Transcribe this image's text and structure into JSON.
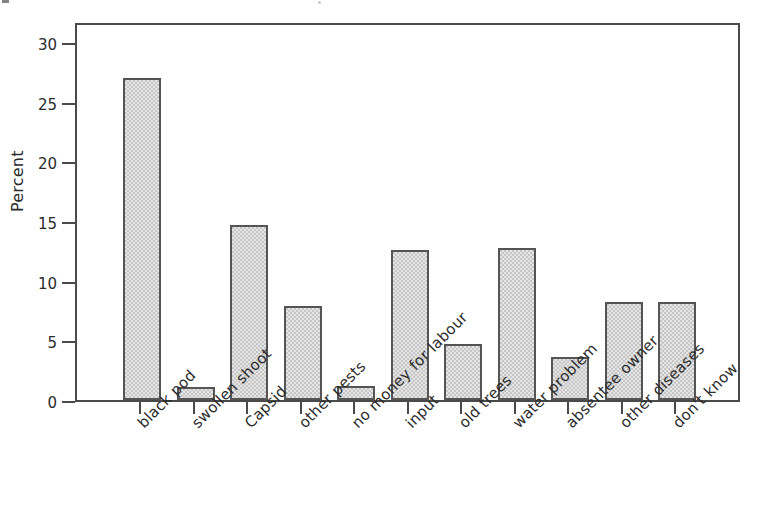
{
  "figure": {
    "background_color": "#ffffff",
    "bar_fill_color": "#c6c6c6",
    "bar_border_color": "#555555",
    "axis_color": "#4a4a4a",
    "text_color": "#2b2b2b"
  },
  "chart_data": {
    "type": "bar",
    "title": "",
    "subtitle": "",
    "xlabel": "",
    "ylabel": "Percent",
    "categories": [
      "black pod",
      "swollen shoot",
      "Capsid",
      "other pests",
      "no money for labour",
      "input",
      "old trees",
      "water problem",
      "absentee owner",
      "other diseases",
      "don't know"
    ],
    "values": [
      27.0,
      1.1,
      14.7,
      7.9,
      1.2,
      12.6,
      4.7,
      12.7,
      3.6,
      8.2,
      8.2
    ],
    "ylim": [
      0,
      31.7
    ],
    "yticks": [
      0,
      5,
      10,
      15,
      20,
      25,
      30
    ],
    "ytick_labels": [
      "0",
      "5",
      "10",
      "15",
      "20",
      "25",
      "30"
    ],
    "grid": false,
    "legend": false,
    "legend_position": "none",
    "x_tick_label_rotation": -45
  }
}
